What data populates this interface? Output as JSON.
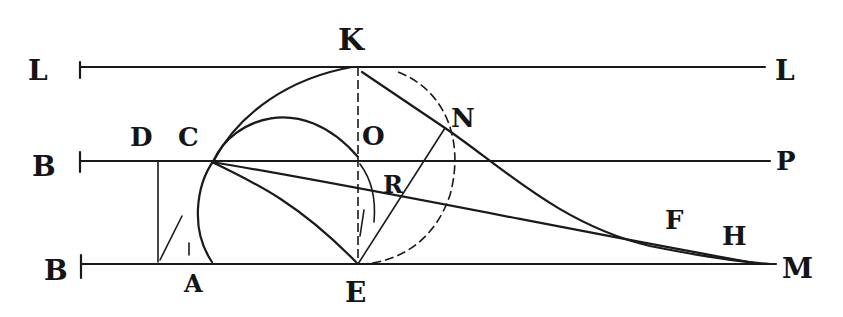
{
  "figure": {
    "width": 843,
    "height": 317,
    "background": "#ffffff",
    "ink": "#1a1a1a"
  },
  "labels": {
    "K": {
      "text": "K",
      "x": 338,
      "y": 50,
      "size": 30
    },
    "L_left": {
      "text": "L",
      "x": 28,
      "y": 80,
      "size": 28
    },
    "L_right": {
      "text": "L",
      "x": 775,
      "y": 80,
      "size": 28
    },
    "B_mid": {
      "text": "B",
      "x": 32,
      "y": 176,
      "size": 28
    },
    "D": {
      "text": "D",
      "x": 130,
      "y": 146,
      "size": 26
    },
    "C": {
      "text": "C",
      "x": 178,
      "y": 146,
      "size": 26
    },
    "O": {
      "text": "O",
      "x": 362,
      "y": 145,
      "size": 26
    },
    "N": {
      "text": "N",
      "x": 451,
      "y": 127,
      "size": 26
    },
    "P": {
      "text": "P",
      "x": 776,
      "y": 170,
      "size": 26
    },
    "R": {
      "text": "R",
      "x": 383,
      "y": 193,
      "size": 24
    },
    "F": {
      "text": "F",
      "x": 665,
      "y": 229,
      "size": 26
    },
    "H": {
      "text": "H",
      "x": 722,
      "y": 245,
      "size": 26
    },
    "B_bottom": {
      "text": "B",
      "x": 44,
      "y": 280,
      "size": 28
    },
    "M": {
      "text": "M",
      "x": 782,
      "y": 278,
      "size": 28
    },
    "A": {
      "text": "A",
      "x": 184,
      "y": 292,
      "size": 24
    },
    "E": {
      "text": "E",
      "x": 345,
      "y": 302,
      "size": 28
    }
  },
  "geometry": {
    "lines": {
      "top_LL": {
        "x1": 80,
        "y1": 67,
        "x2": 765,
        "y2": 67
      },
      "mid_BP": {
        "x1": 80,
        "y1": 161,
        "x2": 770,
        "y2": 161
      },
      "bottom_BM": {
        "x1": 82,
        "y1": 264,
        "x2": 776,
        "y2": 264
      },
      "KE_vertical": {
        "x1": 358,
        "y1": 67,
        "x2": 358,
        "y2": 264
      },
      "D_vertical": {
        "x1": 158,
        "y1": 161,
        "x2": 158,
        "y2": 262
      },
      "CE": {
        "x1": 212,
        "y1": 162,
        "x2": 358,
        "y2": 264
      },
      "CM": {
        "x1": 212,
        "y1": 162,
        "x2": 760,
        "y2": 264
      },
      "EN": {
        "x1": 358,
        "y1": 264,
        "x2": 445,
        "y2": 128
      },
      "KN_curve_start": {
        "x1": 362,
        "y1": 72,
        "x2": 445,
        "y2": 128
      }
    },
    "ticks": {
      "tick_top_left": {
        "x": 80,
        "y1": 62,
        "y2": 78
      },
      "tick_mid_left": {
        "x": 80,
        "y1": 152,
        "y2": 172
      },
      "tick_bot_left": {
        "x": 81,
        "y1": 255,
        "y2": 278
      }
    }
  }
}
